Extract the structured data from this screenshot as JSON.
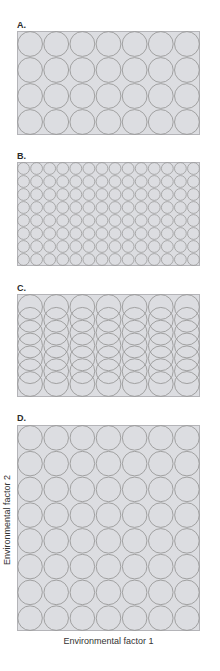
{
  "figure": {
    "fill_color": "#dcdde1",
    "stroke_color": "#9a9a9a",
    "border_color": "#b4b4b8",
    "panels": [
      {
        "id": "A",
        "label": "A.",
        "layout": "grid",
        "columns": 7,
        "rows": 4,
        "circle_diameter": 26
      },
      {
        "id": "B",
        "label": "B.",
        "layout": "grid",
        "columns": 14,
        "rows": 8,
        "circle_diameter": 13
      },
      {
        "id": "C",
        "label": "C.",
        "layout": "overlapping-columns",
        "columns": 7,
        "circles_per_column": 7,
        "circle_diameter": 26,
        "vertical_step": 13
      },
      {
        "id": "D",
        "label": "D.",
        "layout": "grid",
        "columns": 7,
        "rows": 8,
        "circle_diameter": 26
      }
    ],
    "x_axis_label": "Environmental factor 1",
    "y_axis_label": "Environmental factor 2"
  }
}
